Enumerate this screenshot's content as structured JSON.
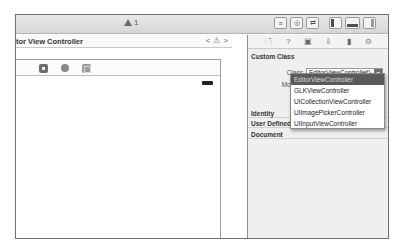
{
  "toolbar": {
    "activity": {
      "icon": "warning-icon",
      "count": "1"
    },
    "editor_buttons": [
      "standard-editor-icon",
      "assistant-editor-icon",
      "version-editor-icon"
    ],
    "view_buttons": [
      "navigator-pane-icon",
      "debug-area-icon",
      "utilities-pane-icon"
    ]
  },
  "editor": {
    "title": "tor View Controller",
    "jump_bar": {
      "prev": "<",
      "warning": "⚠",
      "next": ">"
    },
    "scene_dock": [
      "view-controller-icon",
      "first-responder-icon",
      "exit-icon"
    ]
  },
  "inspector": {
    "tabs": [
      "file-inspector-icon",
      "quick-help-icon",
      "identity-inspector-icon",
      "attributes-inspector-icon",
      "size-inspector-icon",
      "connections-inspector-icon"
    ],
    "tab_glyphs": [
      "🗋",
      "?",
      "▣",
      "⇩",
      "▮",
      "⊖"
    ],
    "custom_class": {
      "title": "Custom Class",
      "class_label": "Class",
      "class_value": "EditorViewController",
      "module_label": "Module"
    },
    "sections": [
      "Identity",
      "User Defined Ru",
      "Document"
    ]
  },
  "dropdown": {
    "items": [
      {
        "label": "EditorViewController",
        "selected": true
      },
      {
        "label": "GLKViewController",
        "selected": false
      },
      {
        "label": "UICollectionViewController",
        "selected": false
      },
      {
        "label": "UIImagePickerController",
        "selected": false
      },
      {
        "label": "UIInputViewController",
        "selected": false
      }
    ]
  }
}
